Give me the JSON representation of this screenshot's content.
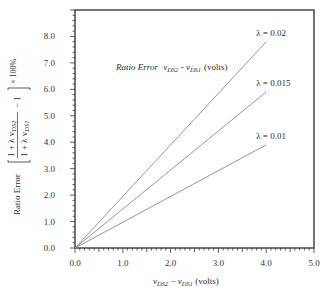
{
  "chart_data": {
    "type": "line",
    "title_parts": {
      "italic": "Ratio Error",
      "var1": "v",
      "var1_sub": "DS2",
      "sep": " - ",
      "var2": "v",
      "var2_sub": "DS1",
      "units": "(volts)"
    },
    "xlabel": "vDS2 − vDS1 (volts)",
    "xlabel_parts": {
      "var1": "v",
      "var1_sub": "DS2",
      "sep": " − ",
      "var2": "v",
      "var2_sub": "DS1",
      "units": " (volts)"
    },
    "ylabel": "Ratio Error [ (1 + λ vDS2) / (1 + λ vDS1) − 1 ] × 100%",
    "ylabel_parts": {
      "prefix": "Ratio Error",
      "num": "1 + λ v",
      "num_sub": "DS2",
      "den": "1 + λ v",
      "den_sub": "DS1",
      "minus_one": "− 1",
      "suffix": "× 100%"
    },
    "xlim": [
      0,
      5.0
    ],
    "ylim": [
      0,
      9.0
    ],
    "x_ticks": [
      "0.0",
      "1.0",
      "2.0",
      "3.0",
      "4.0",
      "5.0"
    ],
    "y_ticks": [
      "0.0",
      "1.0",
      "2.0",
      "3.0",
      "4.0",
      "5.0",
      "6.0",
      "7.0",
      "8.0"
    ],
    "grid": false,
    "legend": "inline labels at line ends",
    "series": [
      {
        "name": "λ = 0.02",
        "x": [
          0.0,
          4.0
        ],
        "y": [
          0.0,
          7.8
        ]
      },
      {
        "name": "λ = 0.015",
        "x": [
          0.0,
          4.0
        ],
        "y": [
          0.0,
          5.9
        ]
      },
      {
        "name": "λ = 0.01",
        "x": [
          0.0,
          4.0
        ],
        "y": [
          0.0,
          3.9
        ]
      }
    ],
    "colors": {
      "axis": "#3a3a3a",
      "line": "#8a8a8a",
      "text": "#2a2a2a"
    }
  }
}
